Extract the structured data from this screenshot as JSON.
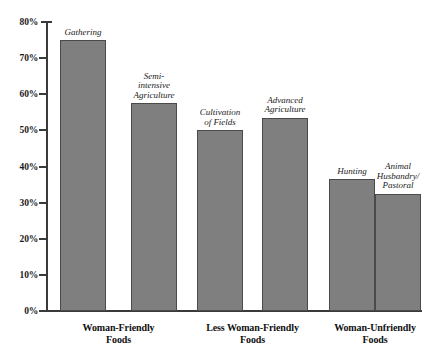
{
  "chart_data": {
    "type": "bar",
    "title": "",
    "xlabel": "",
    "ylabel": "",
    "ylim": [
      0,
      80
    ],
    "grid": false,
    "legend": "none",
    "y_ticks": [
      "80%",
      "70%",
      "60%",
      "50%",
      "40%",
      "30%",
      "20%",
      "10%",
      "0%"
    ],
    "y_tick_values": [
      80,
      70,
      60,
      50,
      40,
      30,
      20,
      10,
      0
    ],
    "axis_unit": "percent",
    "bar_color": "#807f7f",
    "bar_outline_color": "#4a4a4a",
    "axis_color": "#3a3a3a",
    "text_color": "#1a1a1a",
    "categories": [
      "Woman-Friendly Foods",
      "Less Woman-Friendly Foods",
      "Woman-Unfriendly Foods"
    ],
    "bars": [
      {
        "label": "Gathering",
        "label_lines": [
          "Gathering"
        ],
        "value": 75.0,
        "group": "Woman-Friendly Foods"
      },
      {
        "label": "Semi-intensive Agriculture",
        "label_lines": [
          "Semi-",
          "intensive",
          "Agriculture"
        ],
        "value": 57.5,
        "group": "Woman-Friendly Foods"
      },
      {
        "label": "Cultivation of Fields",
        "label_lines": [
          "Cultivation",
          "of Fields"
        ],
        "value": 50.0,
        "group": "Less Woman-Friendly Foods"
      },
      {
        "label": "Advanced Agriculture",
        "label_lines": [
          "Advanced",
          "Agriculture"
        ],
        "value": 53.5,
        "group": "Less Woman-Friendly Foods"
      },
      {
        "label": "Hunting",
        "label_lines": [
          "Hunting"
        ],
        "value": 36.5,
        "group": "Woman-Unfriendly Foods"
      },
      {
        "label": "Animal Husbandry/ Pastoral",
        "label_lines": [
          "Animal",
          "Husbandry/",
          "Pastoral"
        ],
        "value": 32.5,
        "group": "Woman-Unfriendly Foods"
      }
    ],
    "group_labels": [
      {
        "line1": "Woman-Friendly",
        "line2": "Foods"
      },
      {
        "line1": "Less Woman-Friendly",
        "line2": "Foods"
      },
      {
        "line1": "Woman-Unfriendly",
        "line2": "Foods"
      }
    ]
  }
}
